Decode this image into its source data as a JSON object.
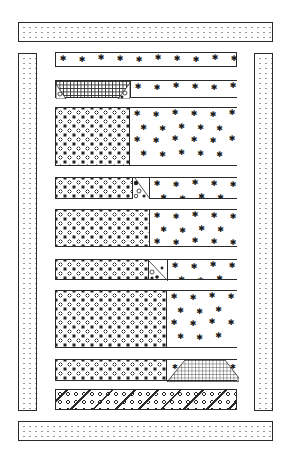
{
  "colors": {
    "ink": "#2a2a2a",
    "background": "#ffffff",
    "dot": "#9a9a9a"
  },
  "fabrics": {
    "border": "pin-dot",
    "floral": "tossed-floral",
    "star": "scattered-star",
    "grid": "windowpane-check",
    "stripe": "diagonal-floral-stripe"
  },
  "borders": {
    "top": {
      "x": 18,
      "y": 22,
      "w": 255,
      "h": 20,
      "fabric": "pin-dot"
    },
    "bottom": {
      "x": 18,
      "y": 421,
      "w": 255,
      "h": 20,
      "fabric": "pin-dot"
    },
    "left": {
      "x": 18,
      "y": 53,
      "w": 19,
      "h": 358,
      "fabric": "pin-dot"
    },
    "right": {
      "x": 254,
      "y": 53,
      "w": 19,
      "h": 358,
      "fabric": "pin-dot"
    }
  },
  "strips": [
    {
      "id": 1,
      "y": 52,
      "h": 15,
      "segments": [
        {
          "fabric": "star",
          "w": 182
        }
      ]
    },
    {
      "id": 2,
      "y": 80,
      "h": 18,
      "segments": [
        {
          "fabric": "grid",
          "w": 74,
          "corners": "floral"
        },
        {
          "fabric": "star",
          "w": 108
        }
      ]
    },
    {
      "id": 3,
      "y": 107,
      "h": 59,
      "segments": [
        {
          "fabric": "floral",
          "w": 73
        },
        {
          "fabric": "star",
          "w": 109
        }
      ]
    },
    {
      "id": 4,
      "y": 177,
      "h": 22,
      "segments": [
        {
          "fabric": "floral",
          "w": 76
        },
        {
          "fabric": "floral-triangle",
          "w": 17
        },
        {
          "fabric": "star",
          "w": 89
        }
      ]
    },
    {
      "id": 5,
      "y": 209,
      "h": 38,
      "segments": [
        {
          "fabric": "floral",
          "w": 93
        },
        {
          "fabric": "star",
          "w": 89
        }
      ]
    },
    {
      "id": 6,
      "y": 259,
      "h": 21,
      "segments": [
        {
          "fabric": "floral",
          "w": 92
        },
        {
          "fabric": "floral-triangle",
          "w": 19
        },
        {
          "fabric": "star",
          "w": 71
        }
      ]
    },
    {
      "id": 7,
      "y": 290,
      "h": 58,
      "segments": [
        {
          "fabric": "floral",
          "w": 110
        },
        {
          "fabric": "star",
          "w": 72
        }
      ]
    },
    {
      "id": 8,
      "y": 359,
      "h": 22,
      "segments": [
        {
          "fabric": "floral",
          "w": 110
        },
        {
          "fabric": "grid-trapezoid",
          "w": 72,
          "corners": "star"
        }
      ]
    },
    {
      "id": 9,
      "y": 389,
      "h": 21,
      "segments": [
        {
          "fabric": "stripe",
          "w": 182
        }
      ]
    }
  ],
  "strip_x": 55,
  "strip_width": 182,
  "star_glyph": "✱"
}
